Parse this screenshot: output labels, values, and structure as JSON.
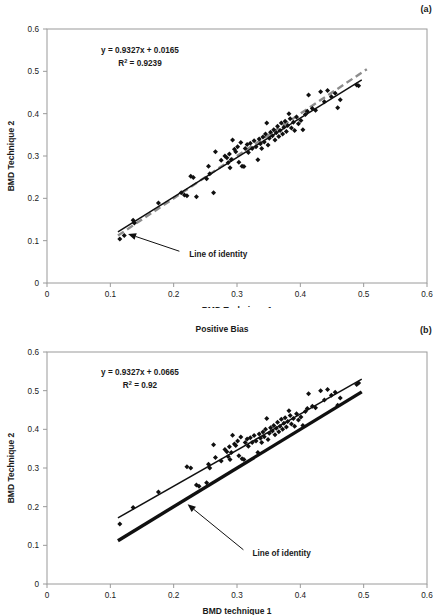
{
  "figure": {
    "panels": [
      {
        "id": "a",
        "label": "(a)",
        "title": "",
        "equation": "y = 0.9327x + 0.0165",
        "r2_prefix": "R",
        "r2_sup": "2",
        "r2_value": " = 0.9239",
        "annotation": "Line of identity"
      },
      {
        "id": "b",
        "label": "(b)",
        "title": "Positive Bias",
        "equation": "y = 0.9327x + 0.0665",
        "r2_prefix": "R",
        "r2_sup": "2",
        "r2_value": " = 0.92",
        "annotation": "Line of identity"
      }
    ]
  },
  "chart_data": [
    {
      "type": "scatter",
      "panel": "a",
      "title": "",
      "xlabel": "BMD Technique 1",
      "ylabel": "BMD Technique 2",
      "xlim": [
        0,
        0.6
      ],
      "ylim": [
        0,
        0.6
      ],
      "xticks": [
        0,
        0.1,
        0.2,
        0.3,
        0.4,
        0.5,
        0.6
      ],
      "yticks": [
        0,
        0.1,
        0.2,
        0.3,
        0.4,
        0.5,
        0.6
      ],
      "xticklabels": [
        "0",
        "0.1",
        "0.2",
        "0.3",
        "0.4",
        "0.5",
        "0.6"
      ],
      "yticklabels": [
        "0",
        "0.1",
        "0.2",
        "0.3",
        "0.4",
        "0.5",
        "0.6"
      ],
      "grid": false,
      "legend": "none",
      "fit": {
        "slope": 0.9327,
        "intercept": 0.0165,
        "r2": 0.9239,
        "x_from": 0.112,
        "x_to": 0.497,
        "color": "#101010",
        "style": "solid"
      },
      "identity": {
        "slope": 1.0,
        "intercept": 0.0,
        "x_from": 0.112,
        "x_to": 0.505,
        "color": "#8d8d8d",
        "style": "dashed"
      },
      "marker": "diamond",
      "marker_color": "#101010",
      "annotation": {
        "text": "Line of identity",
        "text_x": 0.215,
        "text_y": 0.072,
        "arrow_to_x": 0.128,
        "arrow_to_y": 0.116
      },
      "points": [
        [
          0.115,
          0.104
        ],
        [
          0.122,
          0.112
        ],
        [
          0.136,
          0.148
        ],
        [
          0.138,
          0.142
        ],
        [
          0.176,
          0.189
        ],
        [
          0.212,
          0.213
        ],
        [
          0.217,
          0.208
        ],
        [
          0.221,
          0.206
        ],
        [
          0.227,
          0.252
        ],
        [
          0.231,
          0.249
        ],
        [
          0.236,
          0.204
        ],
        [
          0.252,
          0.246
        ],
        [
          0.255,
          0.276
        ],
        [
          0.257,
          0.258
        ],
        [
          0.263,
          0.213
        ],
        [
          0.266,
          0.31
        ],
        [
          0.275,
          0.29
        ],
        [
          0.281,
          0.3
        ],
        [
          0.284,
          0.296
        ],
        [
          0.286,
          0.284
        ],
        [
          0.288,
          0.305
        ],
        [
          0.289,
          0.272
        ],
        [
          0.291,
          0.292
        ],
        [
          0.293,
          0.338
        ],
        [
          0.296,
          0.316
        ],
        [
          0.298,
          0.31
        ],
        [
          0.301,
          0.322
        ],
        [
          0.303,
          0.285
        ],
        [
          0.306,
          0.332
        ],
        [
          0.308,
          0.276
        ],
        [
          0.311,
          0.275
        ],
        [
          0.313,
          0.318
        ],
        [
          0.316,
          0.327
        ],
        [
          0.318,
          0.308
        ],
        [
          0.321,
          0.33
        ],
        [
          0.324,
          0.318
        ],
        [
          0.327,
          0.336
        ],
        [
          0.33,
          0.322
        ],
        [
          0.333,
          0.291
        ],
        [
          0.335,
          0.34
        ],
        [
          0.337,
          0.329
        ],
        [
          0.339,
          0.318
        ],
        [
          0.341,
          0.345
        ],
        [
          0.343,
          0.333
        ],
        [
          0.345,
          0.352
        ],
        [
          0.347,
          0.378
        ],
        [
          0.349,
          0.326
        ],
        [
          0.351,
          0.342
        ],
        [
          0.353,
          0.356
        ],
        [
          0.356,
          0.348
        ],
        [
          0.358,
          0.362
        ],
        [
          0.36,
          0.338
        ],
        [
          0.362,
          0.355
        ],
        [
          0.364,
          0.37
        ],
        [
          0.366,
          0.346
        ],
        [
          0.368,
          0.36
        ],
        [
          0.37,
          0.378
        ],
        [
          0.372,
          0.352
        ],
        [
          0.374,
          0.368
        ],
        [
          0.376,
          0.382
        ],
        [
          0.378,
          0.358
        ],
        [
          0.38,
          0.372
        ],
        [
          0.382,
          0.4
        ],
        [
          0.384,
          0.388
        ],
        [
          0.386,
          0.366
        ],
        [
          0.389,
          0.38
        ],
        [
          0.391,
          0.36
        ],
        [
          0.394,
          0.392
        ],
        [
          0.397,
          0.376
        ],
        [
          0.401,
          0.384
        ],
        [
          0.404,
          0.362
        ],
        [
          0.408,
          0.398
        ],
        [
          0.411,
          0.406
        ],
        [
          0.413,
          0.444
        ],
        [
          0.419,
          0.412
        ],
        [
          0.424,
          0.408
        ],
        [
          0.432,
          0.452
        ],
        [
          0.438,
          0.428
        ],
        [
          0.443,
          0.455
        ],
        [
          0.449,
          0.44
        ],
        [
          0.455,
          0.448
        ],
        [
          0.459,
          0.414
        ],
        [
          0.463,
          0.433
        ],
        [
          0.489,
          0.468
        ],
        [
          0.492,
          0.466
        ]
      ]
    },
    {
      "type": "scatter",
      "panel": "b",
      "title": "Positive Bias",
      "xlabel": "BMD technique 1",
      "ylabel": "BMD Technique 2",
      "xlim": [
        0,
        0.6
      ],
      "ylim": [
        0,
        0.6
      ],
      "xticks": [
        0,
        0.1,
        0.2,
        0.3,
        0.4,
        0.5,
        0.6
      ],
      "yticks": [
        0,
        0.1,
        0.2,
        0.3,
        0.4,
        0.5,
        0.6
      ],
      "xticklabels": [
        "0",
        "0.1",
        "0.2",
        "0.3",
        "0.4",
        "0.5",
        "0.6"
      ],
      "yticklabels": [
        "0",
        "0.1",
        "0.2",
        "0.3",
        "0.4",
        "0.5",
        "0.6"
      ],
      "grid": false,
      "legend": "none",
      "fit": {
        "slope": 0.9327,
        "intercept": 0.0665,
        "r2": 0.92,
        "x_from": 0.112,
        "x_to": 0.497,
        "color": "#101010",
        "style": "solid"
      },
      "identity": {
        "slope": 1.0,
        "intercept": 0.0,
        "x_from": 0.112,
        "x_to": 0.497,
        "color": "#101010",
        "style": "solid-thick"
      },
      "marker": "diamond",
      "marker_color": "#101010",
      "annotation": {
        "text": "Line of identity",
        "text_x": 0.315,
        "text_y": 0.082,
        "arrow_to_x": 0.222,
        "arrow_to_y": 0.206
      },
      "points": [
        [
          0.115,
          0.155
        ],
        [
          0.136,
          0.198
        ],
        [
          0.176,
          0.238
        ],
        [
          0.221,
          0.303
        ],
        [
          0.227,
          0.3
        ],
        [
          0.236,
          0.256
        ],
        [
          0.24,
          0.253
        ],
        [
          0.252,
          0.262
        ],
        [
          0.255,
          0.31
        ],
        [
          0.257,
          0.3
        ],
        [
          0.263,
          0.36
        ],
        [
          0.266,
          0.327
        ],
        [
          0.275,
          0.318
        ],
        [
          0.281,
          0.348
        ],
        [
          0.284,
          0.342
        ],
        [
          0.286,
          0.33
        ],
        [
          0.288,
          0.355
        ],
        [
          0.289,
          0.322
        ],
        [
          0.291,
          0.34
        ],
        [
          0.293,
          0.385
        ],
        [
          0.296,
          0.362
        ],
        [
          0.298,
          0.358
        ],
        [
          0.301,
          0.37
        ],
        [
          0.303,
          0.332
        ],
        [
          0.306,
          0.38
        ],
        [
          0.308,
          0.324
        ],
        [
          0.311,
          0.322
        ],
        [
          0.313,
          0.366
        ],
        [
          0.316,
          0.375
        ],
        [
          0.318,
          0.356
        ],
        [
          0.321,
          0.378
        ],
        [
          0.324,
          0.366
        ],
        [
          0.327,
          0.384
        ],
        [
          0.33,
          0.37
        ],
        [
          0.333,
          0.34
        ],
        [
          0.335,
          0.388
        ],
        [
          0.337,
          0.377
        ],
        [
          0.339,
          0.366
        ],
        [
          0.341,
          0.393
        ],
        [
          0.343,
          0.381
        ],
        [
          0.345,
          0.4
        ],
        [
          0.347,
          0.428
        ],
        [
          0.349,
          0.374
        ],
        [
          0.351,
          0.39
        ],
        [
          0.353,
          0.404
        ],
        [
          0.356,
          0.396
        ],
        [
          0.358,
          0.41
        ],
        [
          0.36,
          0.386
        ],
        [
          0.362,
          0.403
        ],
        [
          0.364,
          0.418
        ],
        [
          0.366,
          0.394
        ],
        [
          0.368,
          0.408
        ],
        [
          0.37,
          0.426
        ],
        [
          0.372,
          0.4
        ],
        [
          0.374,
          0.416
        ],
        [
          0.376,
          0.43
        ],
        [
          0.378,
          0.406
        ],
        [
          0.38,
          0.42
        ],
        [
          0.382,
          0.448
        ],
        [
          0.384,
          0.436
        ],
        [
          0.386,
          0.414
        ],
        [
          0.389,
          0.428
        ],
        [
          0.391,
          0.408
        ],
        [
          0.394,
          0.44
        ],
        [
          0.397,
          0.424
        ],
        [
          0.401,
          0.432
        ],
        [
          0.404,
          0.41
        ],
        [
          0.408,
          0.446
        ],
        [
          0.411,
          0.454
        ],
        [
          0.413,
          0.492
        ],
        [
          0.419,
          0.46
        ],
        [
          0.424,
          0.456
        ],
        [
          0.432,
          0.5
        ],
        [
          0.438,
          0.476
        ],
        [
          0.443,
          0.503
        ],
        [
          0.449,
          0.488
        ],
        [
          0.455,
          0.496
        ],
        [
          0.459,
          0.462
        ],
        [
          0.463,
          0.481
        ],
        [
          0.489,
          0.516
        ],
        [
          0.492,
          0.52
        ]
      ]
    }
  ]
}
